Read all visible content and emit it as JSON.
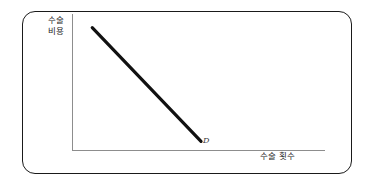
{
  "figure": {
    "name": "demand-curve-diagram",
    "background_color": "#ffffff",
    "frame_color": "#1a1a1a",
    "axis_color": "#8d8d8d",
    "curve_color": "#111111"
  },
  "labels": {
    "y_axis_line1": "수술",
    "y_axis_line2": "비용",
    "x_axis": "수술 횟수",
    "curve": "D"
  },
  "chart_data": {
    "type": "line",
    "title": "",
    "xlabel": "수술 횟수",
    "ylabel": "수술 비용",
    "series": [
      {
        "name": "D",
        "label": "D",
        "x": [
          0.08,
          0.51
        ],
        "y": [
          0.9,
          0.07
        ],
        "color": "#111111",
        "linewidth": 3
      }
    ],
    "annotations": [
      {
        "text": "D",
        "x": 0.53,
        "y": 0.05
      }
    ],
    "xlim": [
      0,
      1
    ],
    "ylim": [
      0,
      1
    ],
    "grid": false,
    "legend": false,
    "axis_ticks": false
  }
}
